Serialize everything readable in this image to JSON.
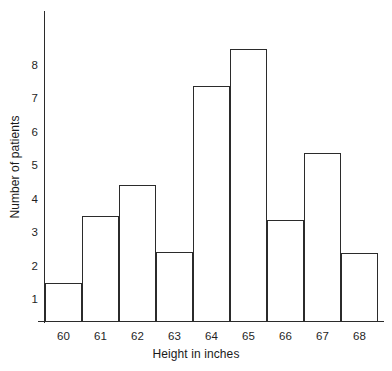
{
  "chart_data": {
    "type": "bar",
    "title": "",
    "xlabel": "Height in inches",
    "ylabel": "Number of patients",
    "categories": [
      "60",
      "61",
      "62",
      "63",
      "64",
      "65",
      "66",
      "67",
      "68"
    ],
    "values": [
      1.5,
      3.5,
      4.45,
      2.45,
      7.4,
      8.5,
      3.4,
      5.4,
      2.4
    ],
    "yticks": [
      "1",
      "2",
      "3",
      "4",
      "5",
      "6",
      "7",
      "8"
    ],
    "ytick_values": [
      1,
      2,
      3,
      4,
      5,
      6,
      7,
      8
    ],
    "ylim": [
      0.35,
      8.9
    ],
    "xlim": [
      "59.5",
      "68.5"
    ],
    "grid": false,
    "legend": false,
    "bar_style": "outlined-adjacent",
    "colors": {
      "bar_outline": "#2b2b2b",
      "bar_fill": "#ffffff",
      "axis": "#2b2b2b",
      "text": "#1a1a1a",
      "background": "#ffffff"
    }
  }
}
